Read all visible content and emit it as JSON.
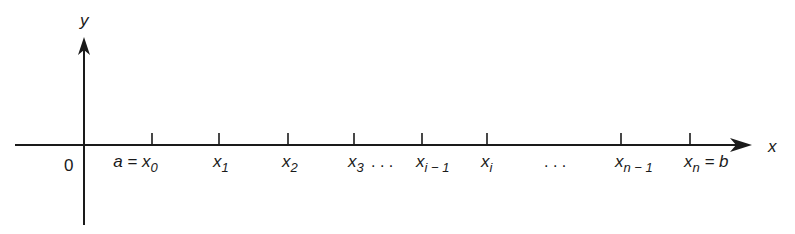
{
  "diagram": {
    "type": "number-line-partition",
    "colors": {
      "ink": "#1a1a1a",
      "background": "#ffffff"
    },
    "axes": {
      "x_label": "x",
      "y_label": "y",
      "origin_label": "0"
    },
    "ticks": [
      {
        "x": 152,
        "label": "a = x",
        "sub": "0",
        "suffix": ""
      },
      {
        "x": 219,
        "label": "x",
        "sub": "1",
        "suffix": ""
      },
      {
        "x": 288,
        "label": "x",
        "sub": "2",
        "suffix": ""
      },
      {
        "x": 354,
        "label": "x",
        "sub": "3",
        "suffix": ""
      },
      {
        "x": 422,
        "label": "x",
        "sub": "i − 1",
        "suffix": ""
      },
      {
        "x": 487,
        "label": "x",
        "sub": "i",
        "suffix": ""
      },
      {
        "x": 621,
        "label": "x",
        "sub": "n − 1",
        "suffix": ""
      },
      {
        "x": 690,
        "label": "x",
        "sub": "n",
        "suffix": " = b"
      }
    ],
    "ellipses": [
      {
        "x": 384,
        "text": ". . ."
      },
      {
        "x": 557,
        "text": ". . ."
      }
    ]
  }
}
